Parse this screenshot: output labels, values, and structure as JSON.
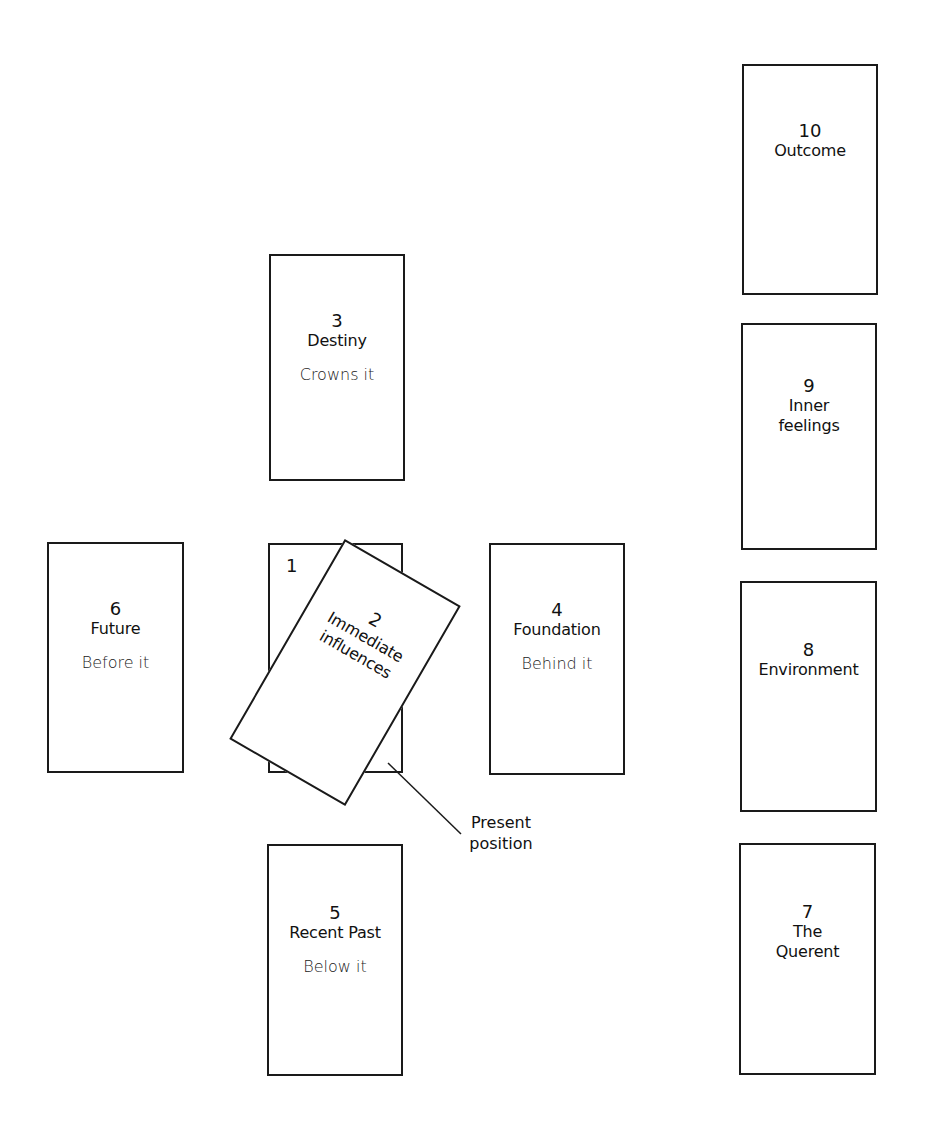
{
  "diagram": {
    "type": "tarot-spread",
    "layout_name": "Celtic Cross",
    "cards": [
      {
        "number": "1",
        "title": "",
        "subtitle": ""
      },
      {
        "number": "2",
        "title_line1": "Immediate",
        "title_line2": "influences",
        "subtitle": ""
      },
      {
        "number": "3",
        "title": "Destiny",
        "subtitle": "Crowns it"
      },
      {
        "number": "4",
        "title": "Foundation",
        "subtitle": "Behind it"
      },
      {
        "number": "5",
        "title": "Recent Past",
        "subtitle": "Below it"
      },
      {
        "number": "6",
        "title": "Future",
        "subtitle": "Before it"
      },
      {
        "number": "7",
        "title_line1": "The",
        "title_line2": "Querent",
        "subtitle": ""
      },
      {
        "number": "8",
        "title": "Environment",
        "subtitle": ""
      },
      {
        "number": "9",
        "title_line1": "Inner",
        "title_line2": "feelings",
        "subtitle": ""
      },
      {
        "number": "10",
        "title": "Outcome",
        "subtitle": ""
      }
    ],
    "callout": {
      "line1": "Present",
      "line2": "position"
    },
    "colors": {
      "stroke": "#1a1a1a",
      "background": "#ffffff",
      "text": "#111111"
    }
  }
}
